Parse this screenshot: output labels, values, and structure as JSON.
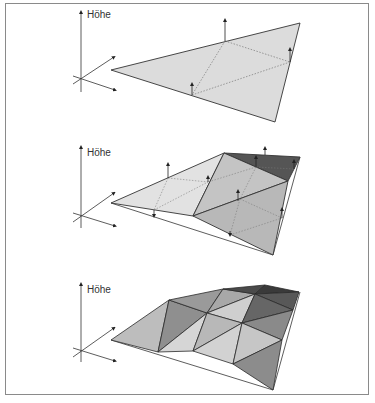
{
  "figure": {
    "panels": [
      {
        "id": "flat",
        "axis_label": "Höhe",
        "label_pos": [
          87,
          9
        ],
        "description": "Flat triangle with height arrows at edge midpoints"
      },
      {
        "id": "refined",
        "axis_label": "Höhe",
        "label_pos": [
          87,
          147
        ],
        "description": "First subdivision with displaced midpoints"
      },
      {
        "id": "fractal",
        "axis_label": "Höhe",
        "label_pos": [
          87,
          284
        ],
        "description": "Second subdivision, shaded fractal terrain"
      }
    ],
    "colors": {
      "frame": "#8a8a8a",
      "light": "#dcdcdc",
      "mid": "#bdbdbd",
      "dark": "#8f8f8f",
      "darker": "#6a6a6a",
      "darkest": "#3e3e3e",
      "stroke": "#333333"
    }
  }
}
